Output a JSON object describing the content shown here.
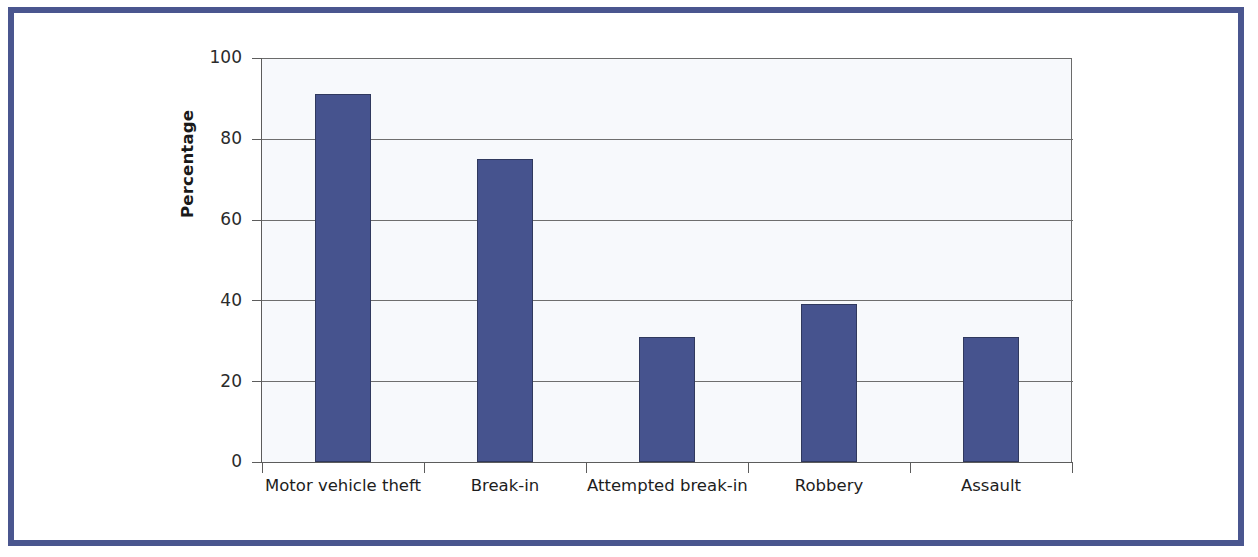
{
  "figure": {
    "frame_color": "#4a568f",
    "background_color": "#ffffff"
  },
  "chart_data": {
    "type": "bar",
    "title": "",
    "subtitle": "",
    "xlabel": "",
    "ylabel": "Percentage",
    "categories": [
      "Motor vehicle theft",
      "Break-in",
      "Attempted break-in",
      "Robbery",
      "Assault"
    ],
    "values": [
      91,
      75,
      31,
      39,
      31
    ],
    "series": [
      {
        "name": "Percentage reported",
        "values": [
          91,
          75,
          31,
          39,
          31
        ]
      }
    ],
    "ylim": [
      0,
      100
    ],
    "y_ticks": [
      0,
      20,
      40,
      60,
      80,
      100
    ],
    "y_tick_labels": [
      "0",
      "20",
      "40",
      "60",
      "80",
      "100"
    ],
    "grid": "horizontal",
    "legend": "none",
    "bar_color": "#46538e",
    "bar_edge_color": "#30395e",
    "plot_background": "#f7f9fc",
    "axis_color": "#5c5c5c"
  }
}
